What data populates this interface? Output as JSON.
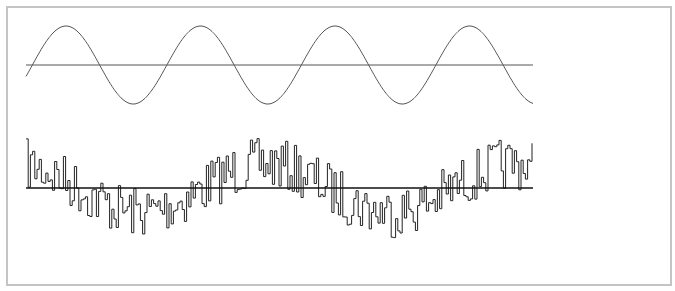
{
  "chart_data": [
    {
      "type": "line",
      "title": "",
      "name": "clean-sine",
      "xlabel": "",
      "ylabel": "",
      "grid": false,
      "description": "Pure sine wave with horizontal zero baseline",
      "x_range_px": [
        26,
        533
      ],
      "baseline_y_px": 65,
      "amplitude_px": 39,
      "period_px": 134.5,
      "phase_peak_x_px": 66,
      "peaks_x_px": [
        66,
        199,
        335,
        470
      ],
      "troughs_x_px": [
        132,
        267,
        402
      ],
      "stroke": "#555555"
    },
    {
      "type": "line",
      "title": "",
      "name": "noisy-signal",
      "xlabel": "",
      "ylabel": "",
      "grid": false,
      "description": "Step-wise noisy signal (low-frequency sine plus noise) with horizontal zero baseline",
      "x_range_px": [
        26,
        533
      ],
      "baseline_y_px": 188,
      "underlying_amplitude_px": 24,
      "underlying_period_px": 250,
      "underlying_trough_x_px": 140,
      "noise_amplitude_px": 26,
      "step_px": 2.2,
      "seed": 7,
      "extremes": {
        "max_y_px": 128,
        "max_x_px": 52,
        "min_y_px": 256,
        "min_x_px": 140
      },
      "stroke": "#222222"
    }
  ],
  "frame": {
    "border_color": "#c4c4c4"
  }
}
